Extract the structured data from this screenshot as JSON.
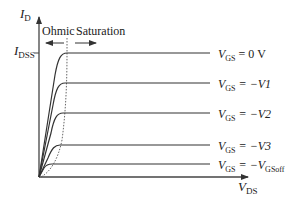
{
  "diagram": {
    "y_axis": {
      "label": "I",
      "label_sub": "D"
    },
    "x_axis": {
      "label": "V",
      "label_sub": "DS"
    },
    "idss": {
      "label": "I",
      "label_sub": "DSS"
    },
    "regions": {
      "ohmic": "Ohmic",
      "saturation": "Saturation"
    },
    "curves": [
      {
        "v": "V",
        "sub": "GS",
        "rest": " = 0 V",
        "sub2": ""
      },
      {
        "v": "V",
        "sub": "GS",
        "rest": " = −V1",
        "sub2": ""
      },
      {
        "v": "V",
        "sub": "GS",
        "rest": " = −V2",
        "sub2": ""
      },
      {
        "v": "V",
        "sub": "GS",
        "rest": " = −V3",
        "sub2": ""
      },
      {
        "v": "V",
        "sub": "GS",
        "rest": " = −V",
        "sub2": "GSoff"
      }
    ],
    "colors": {
      "line": "#333333",
      "text": "#222222",
      "dotted": "#555555"
    }
  }
}
